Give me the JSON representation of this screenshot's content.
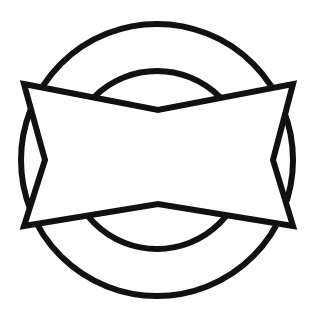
{
  "document": {
    "title": "Geometric Line Drawing",
    "background_color": "#ffffff",
    "width": 319,
    "height": 328
  },
  "figure": {
    "name": "circle-with-bowtie-overlay",
    "stroke_color": "#111111",
    "fill_color": "#ffffff",
    "stroke_width": 6,
    "center": {
      "x": 157,
      "y": 160
    },
    "shapes": [
      {
        "id": "outer-circle",
        "type": "circle",
        "cx": 157,
        "cy": 160,
        "r": 136,
        "stroke_width": 6,
        "fill": "none"
      },
      {
        "id": "inner-circle",
        "type": "circle",
        "cx": 157,
        "cy": 160,
        "r": 89,
        "stroke_width": 6,
        "fill": "none"
      },
      {
        "id": "bowtie-polygon",
        "type": "polygon",
        "fill": "#ffffff",
        "stroke_width": 6,
        "points": "24,84 158,110 293,84 273,160 293,226 158,204 24,226 45,160"
      }
    ]
  },
  "geometry_notes": {
    "outer_circle_extents": {
      "left_x": 21,
      "right_x": 293,
      "top_y": 24,
      "bottom_y": 296
    },
    "inner_circle_extents": {
      "top_y": 71,
      "bottom_y": 249
    },
    "bowtie_vertices": {
      "top_left": [
        24,
        84
      ],
      "top_notch": [
        158,
        110
      ],
      "top_right": [
        293,
        84
      ],
      "right_notch": [
        273,
        160
      ],
      "bottom_right": [
        293,
        226
      ],
      "bottom_notch": [
        158,
        204
      ],
      "bottom_left": [
        24,
        226
      ],
      "left_notch": [
        45,
        160
      ]
    }
  }
}
